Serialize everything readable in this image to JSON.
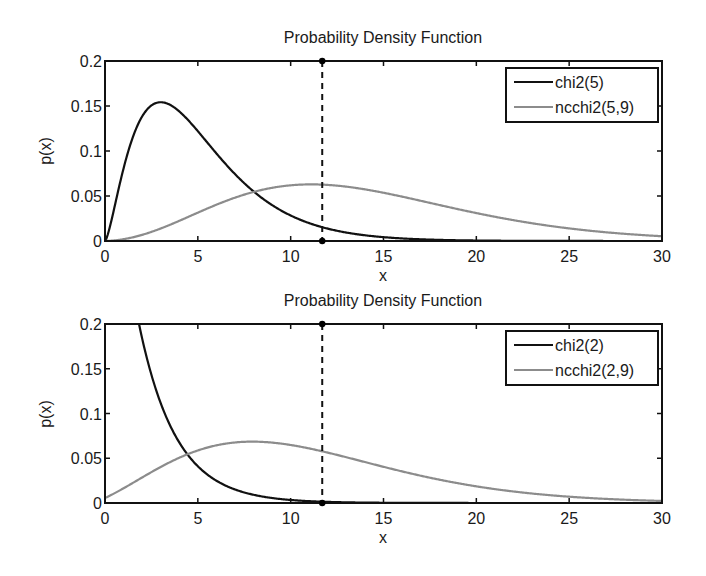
{
  "figure": {
    "width": 706,
    "height": 576,
    "background": "#ffffff"
  },
  "colors": {
    "dark_line": "#111111",
    "gray_line": "#8c8c8c",
    "axis": "#111111",
    "marker": "#000000"
  },
  "chart_data": [
    {
      "type": "line",
      "title": "Probability Density Function",
      "xlabel": "x",
      "ylabel": "p(x)",
      "xlim": [
        0,
        30
      ],
      "ylim": [
        0,
        0.2
      ],
      "xticks": [
        0,
        5,
        10,
        15,
        20,
        25,
        30
      ],
      "xtick_labels": [
        "0",
        "5",
        "10",
        "15",
        "20",
        "25",
        "30"
      ],
      "yticks": [
        0,
        0.05,
        0.1,
        0.15,
        0.2
      ],
      "ytick_labels": [
        "0",
        "0.05",
        "0.1",
        "0.15",
        "0.2"
      ],
      "grid": false,
      "legend_position": "upper right",
      "vertical_marker": {
        "x": 11.7,
        "style": "dashed",
        "endpoint_dots": true
      },
      "series": [
        {
          "name": "chi2(5)",
          "color": "#111111",
          "dist": "chi2",
          "k": 5,
          "lambda": 0,
          "samples": {
            "x": [
              0,
              1,
              2,
              3,
              4,
              5,
              6,
              8,
              10,
              12,
              15,
              20,
              30
            ],
            "y": [
              0,
              0.081,
              0.138,
              0.154,
              0.144,
              0.122,
              0.097,
              0.055,
              0.028,
              0.014,
              0.004,
              0.0005,
              0.0
            ]
          }
        },
        {
          "name": "ncchi2(5,9)",
          "color": "#8c8c8c",
          "dist": "ncchi2",
          "k": 5,
          "lambda": 9,
          "samples": {
            "x": [
              0,
              2,
              4,
              6,
              8,
              10,
              11,
              12,
              14,
              16,
              18,
              20,
              25,
              30
            ],
            "y": [
              0,
              0.012,
              0.03,
              0.046,
              0.057,
              0.062,
              0.063,
              0.062,
              0.058,
              0.051,
              0.042,
              0.034,
              0.016,
              0.006
            ]
          }
        }
      ]
    },
    {
      "type": "line",
      "title": "Probability Density Function",
      "xlabel": "x",
      "ylabel": "p(x)",
      "xlim": [
        0,
        30
      ],
      "ylim": [
        0,
        0.2
      ],
      "xticks": [
        0,
        5,
        10,
        15,
        20,
        25,
        30
      ],
      "xtick_labels": [
        "0",
        "5",
        "10",
        "15",
        "20",
        "25",
        "30"
      ],
      "yticks": [
        0,
        0.05,
        0.1,
        0.15,
        0.2
      ],
      "ytick_labels": [
        "0",
        "0.05",
        "0.1",
        "0.15",
        "0.2"
      ],
      "grid": false,
      "legend_position": "upper right",
      "vertical_marker": {
        "x": 11.7,
        "style": "dashed",
        "endpoint_dots": true
      },
      "series": [
        {
          "name": "chi2(2)",
          "color": "#111111",
          "dist": "chi2",
          "k": 2,
          "lambda": 0,
          "samples": {
            "x": [
              0,
              1,
              1.83,
              2,
              3,
              4,
              5,
              6,
              8,
              10,
              12,
              15
            ],
            "y": [
              0.5,
              0.303,
              0.2,
              0.184,
              0.112,
              0.068,
              0.041,
              0.025,
              0.009,
              0.003,
              0.001,
              0.0003
            ]
          }
        },
        {
          "name": "ncchi2(2,9)",
          "color": "#8c8c8c",
          "dist": "ncchi2",
          "k": 2,
          "lambda": 9,
          "samples": {
            "x": [
              0,
              2,
              4,
              6,
              8,
              10,
              12,
              14,
              16,
              18,
              20,
              25,
              30
            ],
            "y": [
              0.006,
              0.024,
              0.048,
              0.064,
              0.068,
              0.064,
              0.056,
              0.045,
              0.034,
              0.025,
              0.017,
              0.006,
              0.002
            ]
          }
        }
      ]
    }
  ],
  "layout": {
    "axes": [
      {
        "left": 105,
        "top": 61,
        "right": 662,
        "bottom": 241,
        "title_y": 43,
        "xticklabel_y": 262,
        "xlabel_y": 281,
        "legend": {
          "left": 506,
          "top": 68,
          "width": 152,
          "height": 54
        }
      },
      {
        "left": 105,
        "top": 324,
        "right": 662,
        "bottom": 503,
        "title_y": 306,
        "xticklabel_y": 524,
        "xlabel_y": 543,
        "legend": {
          "left": 506,
          "top": 331,
          "width": 152,
          "height": 54
        }
      }
    ]
  }
}
